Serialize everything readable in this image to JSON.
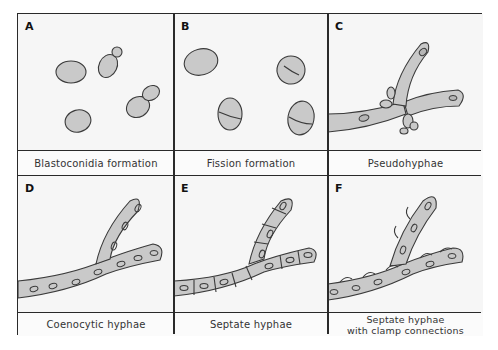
{
  "figure": {
    "panels": [
      {
        "letter": "A",
        "caption": "Blastoconidia formation"
      },
      {
        "letter": "B",
        "caption": "Fission formation"
      },
      {
        "letter": "C",
        "caption": "Pseudohyphae"
      },
      {
        "letter": "D",
        "caption": "Coenocytic hyphae"
      },
      {
        "letter": "E",
        "caption": "Septate hyphae"
      },
      {
        "letter": "F",
        "caption_line1": "Septate hyphae",
        "caption_line2": "with clamp connections"
      }
    ],
    "colors": {
      "border": "#2a2a2a",
      "cell_fill": "#c9c9c9",
      "cell_stroke": "#3a3a3a",
      "background": "#f6f6f6"
    }
  }
}
